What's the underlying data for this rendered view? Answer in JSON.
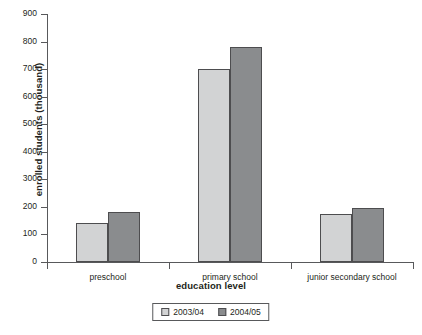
{
  "chart_data": {
    "type": "bar",
    "title": "",
    "subtitle": "",
    "xlabel": "education level",
    "ylabel": "enrolled students (thousand)",
    "categories": [
      "preschool",
      "primary school",
      "junior secondary school"
    ],
    "series": [
      {
        "name": "2003/04",
        "color": "#d2d3d4",
        "values": [
          140,
          700,
          175
        ]
      },
      {
        "name": "2004/05",
        "color": "#8a8c8e",
        "values": [
          182,
          780,
          195
        ]
      }
    ],
    "ylim": [
      0,
      900
    ],
    "ytick_step": 100,
    "yticks": [
      900,
      800,
      700,
      600,
      500,
      400,
      300,
      200,
      100,
      0
    ],
    "ytick_labels": [
      "900",
      "800",
      "700",
      "600",
      "500",
      "400",
      "300",
      "200",
      "100",
      "0"
    ],
    "grid": false,
    "legend_position": "bottom-center",
    "bar_border_color": "#4d4d4f",
    "axis_color": "#58595b",
    "background": "#ffffff"
  }
}
